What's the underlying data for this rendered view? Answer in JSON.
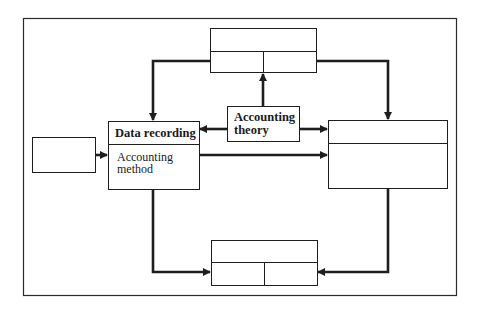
{
  "diagram": {
    "colors": {
      "line": "#1e1e1e",
      "background": "#ffffff"
    },
    "nodes": {
      "input_box": {
        "label": ""
      },
      "top_box": {
        "header": "",
        "cells": [
          "",
          ""
        ]
      },
      "data_recording": {
        "title": "Data recording",
        "body": "Accounting method",
        "body_line1": "Accounting",
        "body_line2": "method"
      },
      "accounting_theory": {
        "label": "Accounting theory",
        "line1": "Accounting",
        "line2": "theory"
      },
      "right_box": {
        "header": "",
        "body": ""
      },
      "bottom_box": {
        "header": "",
        "cells": [
          "",
          ""
        ]
      }
    },
    "edges": [
      {
        "from": "top_box",
        "to": "data_recording"
      },
      {
        "from": "top_box",
        "to": "right_box"
      },
      {
        "from": "accounting_theory",
        "to": "top_box"
      },
      {
        "from": "accounting_theory",
        "to": "data_recording"
      },
      {
        "from": "accounting_theory",
        "to": "right_box"
      },
      {
        "from": "input_box",
        "to": "data_recording"
      },
      {
        "from": "data_recording",
        "to": "right_box"
      },
      {
        "from": "data_recording",
        "to": "bottom_box"
      },
      {
        "from": "right_box",
        "to": "bottom_box"
      }
    ]
  }
}
